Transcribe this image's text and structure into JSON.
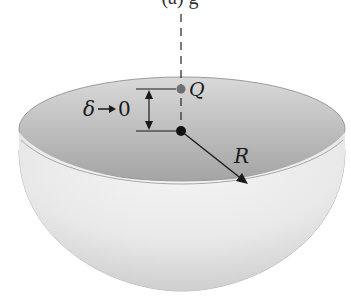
{
  "figure": {
    "caption_partial": "(a)   g",
    "labels": {
      "point_q": "Q",
      "delta": "δ",
      "arrow_glyph": "→",
      "limit_value": "0",
      "radius": "R"
    }
  },
  "colors": {
    "bowl_inner_dark": "#a9a9a9",
    "bowl_inner_light": "#d8d8d8",
    "bowl_outer_light": "#f2f2f2",
    "bowl_outer_shade": "#d0d0d0",
    "center_point": "#111111",
    "point_q": "#6f6f6f",
    "lines": "#1a1a1a"
  }
}
